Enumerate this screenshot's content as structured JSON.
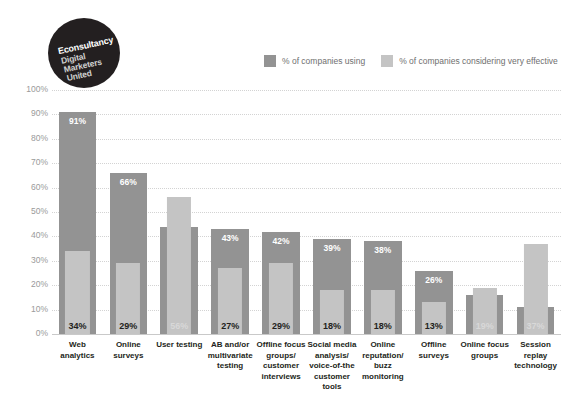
{
  "logo": {
    "name": "econsultancy-logo",
    "line1": "Econsultancy",
    "line2": "Digital",
    "line3": "Marketers",
    "line4": "United",
    "background": "#231f20"
  },
  "legend": {
    "position": "top-right",
    "items": [
      {
        "label": "% of companies using",
        "color": "#939393"
      },
      {
        "label": "% of companies considering very effective",
        "color": "#c4c4c4"
      }
    ]
  },
  "footer": {
    "text": ""
  },
  "chart_data": {
    "type": "bar",
    "title": "",
    "subtitle": "",
    "xlabel": "",
    "ylabel": "",
    "ylim": [
      0,
      100
    ],
    "yticks": [
      "0%",
      "10%",
      "20%",
      "30%",
      "40%",
      "50%",
      "60%",
      "70%",
      "80%",
      "90%",
      "100%"
    ],
    "ytick_values": [
      0,
      10,
      20,
      30,
      40,
      50,
      60,
      70,
      80,
      90,
      100
    ],
    "grid": true,
    "legend_position": "top-right",
    "bar_style": "overlapping",
    "categories": [
      "Web analytics",
      "Online surveys",
      "User testing",
      "AB and/or multivariate testing",
      "Offline focus groups/ customer interviews",
      "Social media analysis/ voice-of-the customer tools",
      "Online reputation/ buzz monitoring",
      "Offline surveys",
      "Online focus groups",
      "Session replay technology"
    ],
    "category_lines": [
      [
        "Web",
        "analytics"
      ],
      [
        "Online",
        "surveys"
      ],
      [
        "User testing"
      ],
      [
        "AB and/or",
        "multivariate",
        "testing"
      ],
      [
        "Offline focus",
        "groups/",
        "customer",
        "interviews"
      ],
      [
        "Social media",
        "analysis/",
        "voice-of-the",
        "customer",
        "tools"
      ],
      [
        "Online",
        "reputation/",
        "buzz",
        "monitoring"
      ],
      [
        "Offline",
        "surveys"
      ],
      [
        "Online focus",
        "groups"
      ],
      [
        "Session",
        "replay",
        "technology"
      ]
    ],
    "series": [
      {
        "name": "% of companies using",
        "color": "#939393",
        "values": [
          91,
          66,
          44,
          43,
          42,
          39,
          38,
          26,
          16,
          11
        ],
        "labels": [
          "91%",
          "66%",
          "44%",
          "43%",
          "42%",
          "39%",
          "38%",
          "26%",
          "16%",
          "11%"
        ]
      },
      {
        "name": "% of companies considering very effective",
        "color": "#c4c4c4",
        "values": [
          34,
          29,
          56,
          27,
          29,
          18,
          18,
          13,
          19,
          37
        ],
        "labels": [
          "34%",
          "29%",
          "56%",
          "27%",
          "29%",
          "18%",
          "18%",
          "13%",
          "19%",
          "37%"
        ]
      }
    ]
  }
}
